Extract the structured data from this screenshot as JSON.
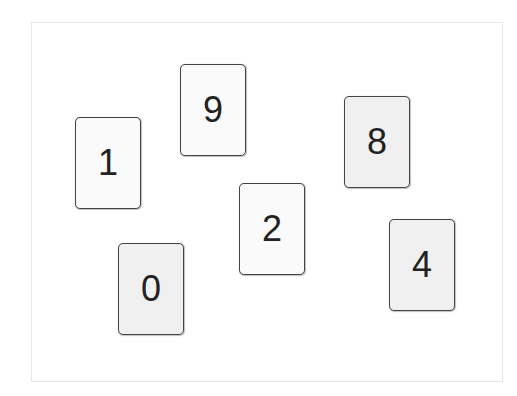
{
  "cards": [
    {
      "label": "1",
      "x": 75,
      "y": 117,
      "shade": "light"
    },
    {
      "label": "9",
      "x": 180,
      "y": 64,
      "shade": "light"
    },
    {
      "label": "8",
      "x": 344,
      "y": 96,
      "shade": "gray"
    },
    {
      "label": "2",
      "x": 239,
      "y": 183,
      "shade": "light"
    },
    {
      "label": "0",
      "x": 118,
      "y": 243,
      "shade": "gray"
    },
    {
      "label": "4",
      "x": 389,
      "y": 219,
      "shade": "gray"
    }
  ]
}
